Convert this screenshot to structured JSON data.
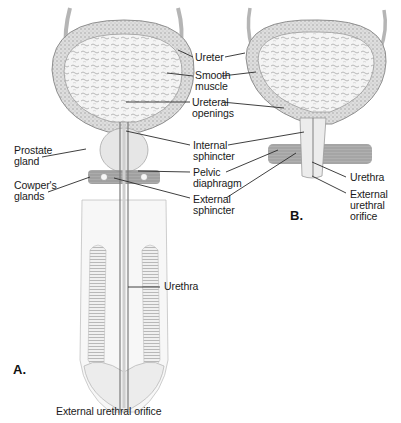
{
  "figure": {
    "panels": [
      {
        "id": "A",
        "label": "A."
      },
      {
        "id": "B",
        "label": "B."
      }
    ],
    "labels": {
      "ureter": "Ureter",
      "smooth_muscle": "Smooth\nmuscle",
      "ureteral_openings": "Ureteral\nopenings",
      "prostate_gland": "Prostate\ngland",
      "internal_sphincter": "Internal\nsphincter",
      "pelvic_diaphragm": "Pelvic\ndiaphragm",
      "cowpers_glands": "Cowper's\nglands",
      "external_sphincter": "External\nsphincter",
      "urethra_b": "Urethra",
      "external_urethral_orifice_b": "External\nurethral\norifice",
      "urethra_a": "Urethra",
      "external_urethral_orifice_a": "External urethral orifice"
    },
    "colors": {
      "ink": "#1a1a1a",
      "tissue_light": "#e8e8e8",
      "tissue_mid": "#bdbdbd",
      "tissue_dark": "#8a8a8a",
      "background": "#ffffff"
    }
  }
}
